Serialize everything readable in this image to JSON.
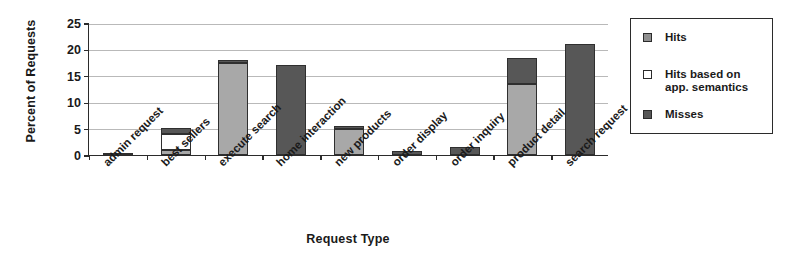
{
  "chart_data": {
    "type": "bar",
    "title": "",
    "xlabel": "Request Type",
    "ylabel": "Percent of Requests",
    "stacked": true,
    "grid": true,
    "legend_position": "right",
    "ylim": [
      0,
      25
    ],
    "yticks": [
      0,
      5,
      10,
      15,
      20,
      25
    ],
    "categories": [
      "admin request",
      "best sellers",
      "execute search",
      "home interaction",
      "new products",
      "order display",
      "order inquiry",
      "product detail",
      "search request"
    ],
    "series": [
      {
        "name": "Hits",
        "color": "#a8a8a8",
        "values": [
          0,
          1.0,
          17.5,
          0,
          5.0,
          0,
          0,
          13.5,
          0
        ]
      },
      {
        "name": "Hits based on\napp. semantics",
        "color": "#ffffff",
        "values": [
          0,
          3.0,
          0,
          0,
          0,
          0,
          0,
          0,
          0
        ]
      },
      {
        "name": "Misses",
        "color": "#575757",
        "values": [
          0.35,
          1.2,
          0.5,
          17.1,
          0.45,
          0.8,
          1.5,
          4.9,
          21.1
        ]
      }
    ],
    "totals": [
      0.35,
      5.2,
      18.0,
      17.1,
      5.45,
      0.8,
      1.5,
      18.4,
      21.1
    ]
  },
  "legend": {
    "items": [
      {
        "label": "Hits",
        "swatch": "hits-swatch"
      },
      {
        "label": "Hits based on\napp. semantics",
        "swatch": "hits-app-semantics-swatch"
      },
      {
        "label": "Misses",
        "swatch": "misses-swatch"
      }
    ]
  },
  "colors": {
    "hits": "#a8a8a8",
    "hits_app_semantics": "#ffffff",
    "misses": "#575757",
    "axis": "#2b2b2b",
    "grid": "#b9b9b9"
  }
}
